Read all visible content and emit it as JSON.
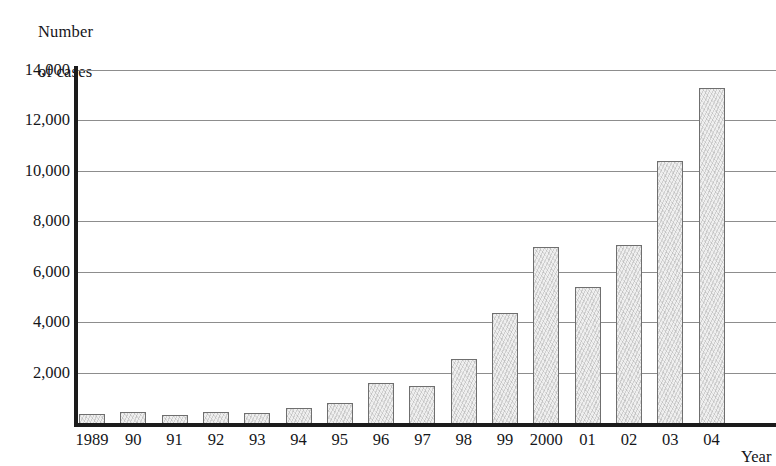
{
  "chart_data": {
    "type": "bar",
    "title": "",
    "ylabel": "Number\nof cases",
    "ylabel_lines": [
      "Number",
      "of cases"
    ],
    "xlabel": "Year",
    "grid": true,
    "legend": null,
    "ylim": [
      0,
      14000
    ],
    "ytick_labels": [
      "14,000",
      "12,000",
      "10,000",
      "8,000",
      "6,000",
      "4,000",
      "2,000"
    ],
    "ytick_values": [
      14000,
      12000,
      10000,
      8000,
      6000,
      4000,
      2000
    ],
    "categories": [
      "1989",
      "90",
      "91",
      "92",
      "93",
      "94",
      "95",
      "96",
      "97",
      "98",
      "99",
      "2000",
      "01",
      "02",
      "03",
      "04"
    ],
    "values": [
      350,
      420,
      330,
      420,
      390,
      600,
      780,
      1600,
      1480,
      2550,
      4350,
      7000,
      5400,
      7050,
      10400,
      13300
    ],
    "note": "rightmost bar (04) is clipped by the right edge of the image"
  }
}
